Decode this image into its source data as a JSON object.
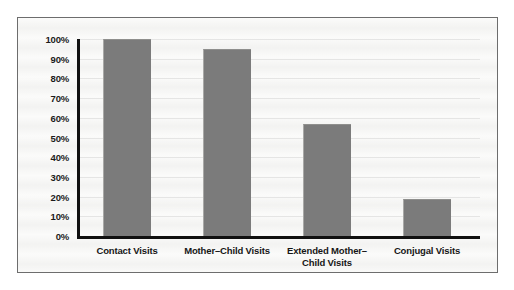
{
  "chart_data": {
    "type": "bar",
    "title": "",
    "xlabel": "",
    "ylabel": "",
    "categories": [
      "Contact Visits",
      "Mother–Child Visits",
      "Extended Mother–Child Visits",
      "Conjugal Visits"
    ],
    "category_lines": [
      [
        "Contact Visits"
      ],
      [
        "Mother–Child Visits"
      ],
      [
        "Extended Mother–",
        "Child Visits"
      ],
      [
        "Conjugal Visits"
      ]
    ],
    "values": [
      100,
      95,
      57,
      19
    ],
    "ylim": [
      0,
      100
    ],
    "yticks": [
      100,
      90,
      80,
      70,
      60,
      50,
      40,
      30,
      20,
      10,
      0
    ],
    "ytick_labels": [
      "100%",
      "90%",
      "80%",
      "70%",
      "60%",
      "50%",
      "40%",
      "30%",
      "20%",
      "10%",
      "0%"
    ],
    "grid": true,
    "legend": "none",
    "colors": {
      "bar_fill": "#7b7b7b",
      "axis": "#111111",
      "frame": "#6d6d6d",
      "background": "#fbfbfa",
      "text": "#161616"
    }
  }
}
